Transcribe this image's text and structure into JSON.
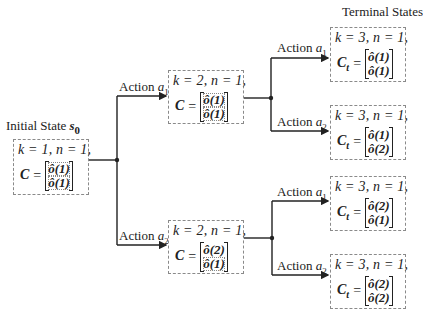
{
  "diagram": {
    "type": "decision-tree",
    "terminal_header": "Terminal States",
    "initial": {
      "title_text": "Initial State ",
      "title_symbol": "s",
      "title_sub": "0",
      "k_line": "k = 1, n = 1,",
      "c_symbol": "C",
      "c_sub": "",
      "matrix": [
        "ô(1)",
        "ô(1)"
      ]
    },
    "level2": [
      {
        "action_text": "Action ",
        "action_symbol": "a",
        "action_sub": "1",
        "k_line": "k = 2, n = 1,",
        "c_symbol": "C",
        "c_sub": "",
        "matrix": [
          "ô(1)",
          "ô(1)"
        ]
      },
      {
        "action_text": "Action ",
        "action_symbol": "a",
        "action_sub": "2",
        "k_line": "k = 2, n = 1,",
        "c_symbol": "C",
        "c_sub": "",
        "matrix": [
          "ô(2)",
          "ô(1)"
        ]
      }
    ],
    "terminals": [
      {
        "action_text": "Action ",
        "action_symbol": "a",
        "action_sub": "1",
        "k_line": "k = 3, n = 1,",
        "c_symbol": "C",
        "c_sub": "t",
        "matrix": [
          "ô(1)",
          "ô(1)"
        ]
      },
      {
        "action_text": "Action ",
        "action_symbol": "a",
        "action_sub": "2",
        "k_line": "k = 3, n = 1,",
        "c_symbol": "C",
        "c_sub": "t",
        "matrix": [
          "ô(1)",
          "ô(2)"
        ]
      },
      {
        "action_text": "Action ",
        "action_symbol": "a",
        "action_sub": "1",
        "k_line": "k = 3, n = 1,",
        "c_symbol": "C",
        "c_sub": "t",
        "matrix": [
          "ô(2)",
          "ô(1)"
        ]
      },
      {
        "action_text": "Action ",
        "action_symbol": "a",
        "action_sub": "2",
        "k_line": "k = 3, n = 1,",
        "c_symbol": "C",
        "c_sub": "t",
        "matrix": [
          "ô(2)",
          "ô(2)"
        ]
      }
    ],
    "colors": {
      "line": "#222222",
      "box_border": "#8a8a8a",
      "background": "#ffffff"
    }
  }
}
